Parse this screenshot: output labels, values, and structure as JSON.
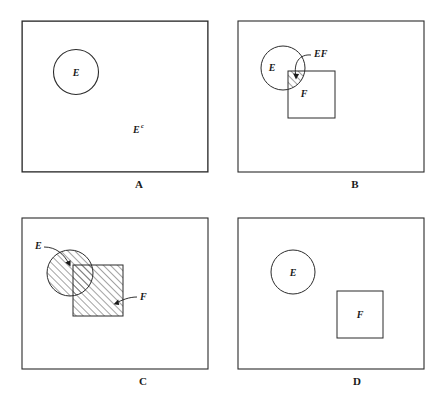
{
  "figure": {
    "background_color": "#ffffff",
    "line_color": "#2b2b2b",
    "hatch_color": "#555555",
    "panels": [
      {
        "id": "A",
        "letter": "A",
        "caption": "Shaded region: E complement",
        "labels": [
          {
            "name": "circle-label-e",
            "text": "E",
            "sup": ""
          },
          {
            "name": "complement-label",
            "text": "E",
            "sup": "c"
          }
        ]
      },
      {
        "id": "B",
        "letter": "B",
        "caption": "Shaded region: EF",
        "labels": [
          {
            "name": "circle-label-e",
            "text": "E",
            "sup": ""
          },
          {
            "name": "square-label-f",
            "text": "F",
            "sup": ""
          },
          {
            "name": "intersection-label-ef",
            "text": "EF",
            "sup": ""
          }
        ]
      },
      {
        "id": "C",
        "letter": "C",
        "caption": "Shaded region: E union F",
        "labels": [
          {
            "name": "circle-label-e",
            "text": "E",
            "sup": ""
          },
          {
            "name": "square-label-f",
            "text": "F",
            "sup": ""
          }
        ]
      },
      {
        "id": "D",
        "letter": "D",
        "caption": "Disjoint events E and F",
        "labels": [
          {
            "name": "circle-label-e",
            "text": "E",
            "sup": ""
          },
          {
            "name": "square-label-f",
            "text": "F",
            "sup": ""
          }
        ]
      }
    ]
  },
  "panel_a": {
    "letter": "A",
    "label_e": "E",
    "label_complement_base": "E",
    "label_complement_sup": "c"
  },
  "panel_b": {
    "letter": "B",
    "label_e": "E",
    "label_f": "F",
    "label_ef": "EF"
  },
  "panel_c": {
    "letter": "C",
    "label_e": "E",
    "label_f": "F"
  },
  "panel_d": {
    "letter": "D",
    "label_e": "E",
    "label_f": "F"
  }
}
